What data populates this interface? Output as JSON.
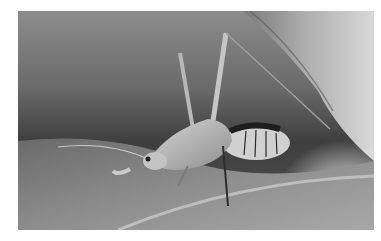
{
  "image": {
    "subject": "katydid on a leaf",
    "style": "grayscale macro photograph",
    "colors": {
      "background_top": "#8a8a8a",
      "background_dark": "#3a3a3a",
      "leaf_light": "#cfcfcf",
      "leaf_mid": "#9a9a9a",
      "insect_body": "#bdbdbd",
      "abdomen_dark": "#1e1e1e"
    }
  }
}
